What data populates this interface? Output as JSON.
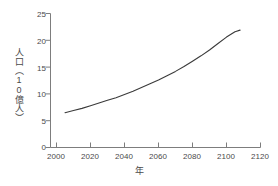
{
  "chart_data": {
    "type": "line",
    "title": "",
    "xlabel": "年",
    "ylabel": "人口（10億人）",
    "ylabel_chars": [
      "人",
      "口",
      "（",
      "1",
      "0",
      "億",
      "人",
      "）"
    ],
    "xlim": [
      2000,
      2120
    ],
    "ylim": [
      0,
      25
    ],
    "xticks": [
      2000,
      2020,
      2040,
      2060,
      2080,
      2100,
      2120
    ],
    "yticks": [
      0,
      5,
      10,
      15,
      20,
      25
    ],
    "grid": false,
    "legend": null,
    "series": [
      {
        "name": "人口",
        "color": "#3a3a3a",
        "x": [
          2005,
          2010,
          2015,
          2020,
          2025,
          2030,
          2035,
          2040,
          2045,
          2050,
          2055,
          2060,
          2065,
          2070,
          2075,
          2080,
          2085,
          2090,
          2095,
          2100,
          2105,
          2108
        ],
        "values": [
          6.5,
          6.9,
          7.3,
          7.8,
          8.3,
          8.8,
          9.3,
          9.9,
          10.5,
          11.2,
          11.9,
          12.6,
          13.4,
          14.2,
          15.1,
          16.1,
          17.1,
          18.2,
          19.4,
          20.6,
          21.6,
          21.9
        ]
      }
    ]
  },
  "axes": {
    "x_tick_labels": [
      "2000",
      "2020",
      "2040",
      "2060",
      "2080",
      "2100",
      "2120"
    ],
    "y_tick_labels": [
      "0",
      "5",
      "10",
      "15",
      "20",
      "25"
    ],
    "axis_color": "#7d7d7d"
  }
}
